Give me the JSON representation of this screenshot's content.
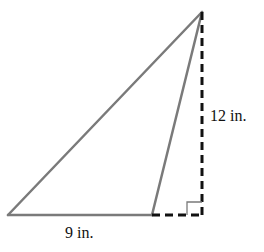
{
  "diagram": {
    "type": "geometry-triangle",
    "colors": {
      "triangle_stroke": "#7a7a7a",
      "dashed_stroke": "#111111",
      "text": "#111111",
      "background": "#ffffff"
    },
    "labels": {
      "height": "12 in.",
      "base": "9 in."
    },
    "vertices": {
      "apex": [
        202,
        12
      ],
      "base_left": [
        8,
        215
      ],
      "base_right": [
        152,
        215
      ],
      "altitude_foot": [
        202,
        215
      ]
    },
    "right_angle_marker": true
  }
}
